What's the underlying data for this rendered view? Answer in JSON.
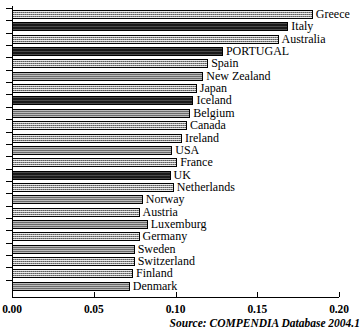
{
  "chart_data": {
    "type": "bar",
    "orientation": "horizontal",
    "title": "",
    "subtitle": "",
    "xlabel": "",
    "ylabel": "",
    "xlim": [
      0.0,
      0.2
    ],
    "grid": false,
    "legend": null,
    "xticks": [
      "0.00",
      "0.05",
      "0.10",
      "0.15",
      "0.20"
    ],
    "xtick_values": [
      0.0,
      0.05,
      0.1,
      0.15,
      0.2
    ],
    "categories": [
      "Greece",
      "Italy",
      "Australia",
      "PORTUGAL",
      "Spain",
      "New Zealand",
      "Japan",
      "Iceland",
      "Belgium",
      "Canada",
      "Ireland",
      "USA",
      "France",
      "UK",
      "Netherlands",
      "Norway",
      "Austria",
      "Luxemburg",
      "Germany",
      "Sweden",
      "Switzerland",
      "Finland",
      "Denmark"
    ],
    "values": [
      0.184,
      0.169,
      0.163,
      0.129,
      0.12,
      0.117,
      0.113,
      0.111,
      0.109,
      0.107,
      0.104,
      0.098,
      0.101,
      0.097,
      0.099,
      0.08,
      0.078,
      0.083,
      0.078,
      0.075,
      0.075,
      0.074,
      0.072
    ],
    "bar_fills": [
      "light",
      "dark",
      "light",
      "dark",
      "light",
      "mid",
      "light",
      "dark",
      "mid",
      "light",
      "light",
      "mid",
      "light",
      "dark",
      "light",
      "mid",
      "light",
      "mid",
      "light",
      "mid",
      "light",
      "light",
      "mid"
    ],
    "annotations": {
      "source": "Source: COMPENDIA Database 2004.1"
    }
  },
  "colors": {
    "axis": "#000000",
    "bar_light": "#8f8f8f",
    "bar_dark": "#1a1a1a",
    "bar_mid": "#6a6a6a",
    "background": "#ffffff"
  }
}
